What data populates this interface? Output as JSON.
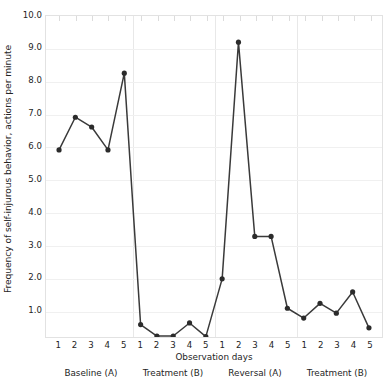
{
  "chart_data": {
    "type": "line",
    "title": "",
    "xlabel": "Observation days",
    "ylabel": "Frequency of self-injurous behavior, actions per minute",
    "ylim": [
      0.17,
      10.0
    ],
    "yticks": [
      10.0,
      9.0,
      8.0,
      7.0,
      6.0,
      5.0,
      4.0,
      3.0,
      2.0,
      1.0
    ],
    "ytick_labels": [
      "10.0",
      "9.0",
      "8.0",
      "7.0",
      "6.0",
      "5.0",
      "4.0",
      "3.0",
      "2.0",
      "1.0"
    ],
    "grid": true,
    "legend": "none",
    "marker": "filled-circle",
    "line_color": "#3a3a3a",
    "marker_color": "#2b2b2b",
    "grid_color": "#f0f0f0",
    "x": [
      1,
      2,
      3,
      4,
      5,
      1,
      2,
      3,
      4,
      5,
      1,
      2,
      3,
      4,
      5,
      1,
      2,
      3,
      4,
      5
    ],
    "xtick_labels": [
      "1",
      "2",
      "3",
      "4",
      "5",
      "1",
      "2",
      "3",
      "4",
      "5",
      "1",
      "2",
      "3",
      "4",
      "5",
      "1",
      "2",
      "3",
      "4",
      "5"
    ],
    "values": [
      5.9,
      6.9,
      6.6,
      5.9,
      8.25,
      0.55,
      0.2,
      0.2,
      0.6,
      0.18,
      1.95,
      9.2,
      3.25,
      3.25,
      1.05,
      0.75,
      1.2,
      0.9,
      1.55,
      0.45
    ],
    "series": [
      {
        "name": "Self-injurious behavior frequency",
        "values": [
          5.9,
          6.9,
          6.6,
          5.9,
          8.25,
          0.55,
          0.2,
          0.2,
          0.6,
          0.18,
          1.95,
          9.2,
          3.25,
          3.25,
          1.05,
          0.75,
          1.2,
          0.9,
          1.55,
          0.45
        ]
      }
    ],
    "phases": [
      {
        "label": "Baseline (A)",
        "start_index": 0,
        "end_index": 4
      },
      {
        "label": "Treatment (B)",
        "start_index": 5,
        "end_index": 9
      },
      {
        "label": "Reversal (A)",
        "start_index": 10,
        "end_index": 14
      },
      {
        "label": "Treatment (B)",
        "start_index": 15,
        "end_index": 19
      }
    ]
  }
}
